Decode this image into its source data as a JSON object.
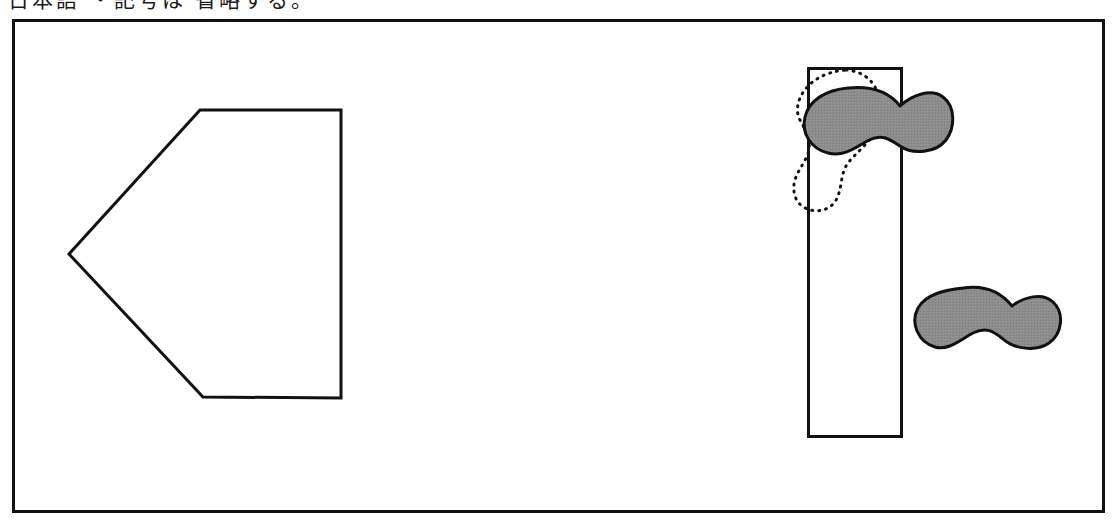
{
  "figure": {
    "background_color": "#ffffff",
    "stroke_color": "#111111",
    "fill_gray": "#8a8a8a",
    "canvas": {
      "width": 1117,
      "height": 528
    },
    "top_text_band": {
      "clipped_text": "日本語 ・記号は 省略する。",
      "note": "bottom sliver of a cropped text line"
    },
    "frame": {
      "name": "outer-border",
      "x": 12,
      "y": 19,
      "width": 1093,
      "height": 494,
      "stroke_width": 3,
      "fill": "none"
    },
    "shapes": [
      {
        "name": "pentagon-left-pointing",
        "type": "polygon",
        "points": "200,110 341,110 341,398 203,397 69,254",
        "stroke_width": 3,
        "fill": "none",
        "label": "pentagon"
      },
      {
        "name": "tall-rectangle",
        "type": "rect",
        "x": 807,
        "y": 67,
        "width": 95,
        "height": 370,
        "stroke_width": 3,
        "fill": "none",
        "label": "rectangle"
      },
      {
        "name": "dotted-blob-vertical",
        "type": "path",
        "stroke_width": 3,
        "stroke_dasharray": "1 6",
        "fill": "none",
        "label": "dotted outline blob"
      },
      {
        "name": "gray-blob-upper",
        "type": "path",
        "stroke_width": 3,
        "fill": "#8a8a8a",
        "label": "shaded blob upper"
      },
      {
        "name": "gray-blob-lower",
        "type": "path",
        "stroke_width": 3,
        "fill": "#8a8a8a",
        "label": "shaded blob lower"
      }
    ]
  }
}
